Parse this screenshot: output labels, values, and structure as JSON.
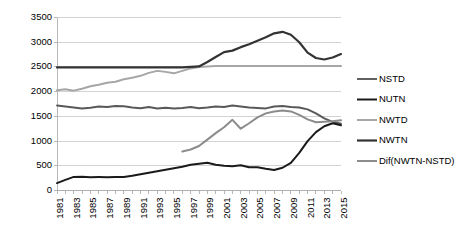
{
  "chart_data": {
    "type": "line",
    "title": "",
    "xlabel": "",
    "ylabel": "",
    "ylim": [
      0,
      3500
    ],
    "ytick_step": 500,
    "yticks": [
      "0",
      "500",
      "1000",
      "1500",
      "2000",
      "2500",
      "3000",
      "3500"
    ],
    "grid": true,
    "legend_position": "right",
    "x": [
      1981,
      1982,
      1983,
      1984,
      1985,
      1986,
      1987,
      1988,
      1989,
      1990,
      1991,
      1992,
      1993,
      1994,
      1995,
      1996,
      1997,
      1998,
      1999,
      2000,
      2001,
      2002,
      2003,
      2004,
      2005,
      2006,
      2007,
      2008,
      2009,
      2010,
      2011,
      2012,
      2013,
      2014,
      2015
    ],
    "xtick_labels": [
      "1981",
      "1983",
      "1985",
      "1987",
      "1989",
      "1991",
      "1993",
      "1995",
      "1997",
      "1999",
      "2001",
      "2003",
      "2005",
      "2007",
      "2009",
      "2011",
      "2013",
      "2015"
    ],
    "series": [
      {
        "name": "NSTD",
        "color": "#595959",
        "width": 1.9,
        "values": [
          1720,
          1700,
          1680,
          1660,
          1675,
          1700,
          1690,
          1710,
          1705,
          1680,
          1665,
          1690,
          1660,
          1675,
          1660,
          1670,
          1690,
          1665,
          1680,
          1700,
          1690,
          1720,
          1700,
          1680,
          1670,
          1660,
          1700,
          1710,
          1690,
          1680,
          1640,
          1560,
          1460,
          1390,
          1350
        ]
      },
      {
        "name": "NUTN",
        "color": "#1a1a1a",
        "width": 2.0,
        "values": [
          150,
          215,
          275,
          280,
          270,
          272,
          270,
          275,
          275,
          300,
          330,
          360,
          390,
          420,
          450,
          480,
          520,
          540,
          560,
          520,
          500,
          490,
          510,
          470,
          470,
          440,
          415,
          460,
          560,
          760,
          1000,
          1180,
          1300,
          1360,
          1320
        ]
      },
      {
        "name": "NWTD",
        "color": "#a6a6a6",
        "width": 2.0,
        "values": [
          2030,
          2050,
          2020,
          2060,
          2110,
          2140,
          2180,
          2200,
          2250,
          2280,
          2320,
          2380,
          2420,
          2400,
          2370,
          2420,
          2470,
          2500,
          2510,
          2520,
          2520,
          2520,
          2520,
          2520,
          2520,
          2520,
          2520,
          2520,
          2520,
          2520,
          2520,
          2520,
          2520,
          2520,
          2520
        ]
      },
      {
        "name": "NWTN",
        "color": "#333333",
        "width": 2.2,
        "values": [
          2490,
          2490,
          2490,
          2490,
          2490,
          2490,
          2490,
          2490,
          2490,
          2490,
          2490,
          2490,
          2490,
          2490,
          2490,
          2490,
          2500,
          2510,
          2600,
          2700,
          2800,
          2830,
          2900,
          2960,
          3030,
          3100,
          3180,
          3210,
          3150,
          3000,
          2790,
          2680,
          2650,
          2690,
          2760
        ]
      },
      {
        "name": "Dif(NWTN-NSTD)",
        "color": "#8c8c8c",
        "width": 2.0,
        "values": [
          null,
          null,
          null,
          null,
          null,
          null,
          null,
          null,
          null,
          null,
          null,
          null,
          null,
          null,
          null,
          790,
          830,
          900,
          1030,
          1160,
          1280,
          1430,
          1250,
          1360,
          1480,
          1560,
          1600,
          1620,
          1600,
          1530,
          1440,
          1380,
          1390,
          1400,
          1420
        ]
      }
    ]
  },
  "legend": {
    "items": [
      {
        "label": "NSTD"
      },
      {
        "label": "NUTN"
      },
      {
        "label": "NWTD"
      },
      {
        "label": "NWTN"
      },
      {
        "label": "Dif(NWTN-NSTD)"
      }
    ]
  }
}
